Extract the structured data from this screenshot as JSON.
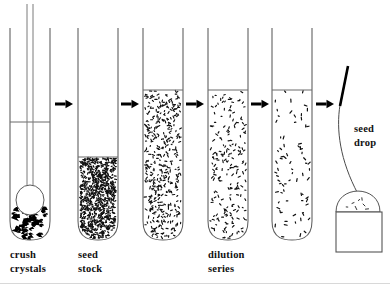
{
  "figure": {
    "background": "#ffffff",
    "ink_color": "#111111",
    "tube_stroke": "#5b5b5b"
  },
  "labels": [
    {
      "id": "crush-crystals",
      "line1": "crush",
      "line2": "crystals",
      "x": 10,
      "y": 258
    },
    {
      "id": "seed-stock",
      "line1": "seed",
      "line2": "stock",
      "x": 78,
      "y": 258
    },
    {
      "id": "dilution-series",
      "line1": "dilution",
      "line2": "series",
      "x": 208,
      "y": 258
    },
    {
      "id": "seed-drop",
      "line1": "seed",
      "line2": "drop",
      "x": 354,
      "y": 132
    }
  ],
  "tubes": [
    {
      "id": "tube-crush",
      "index": 1,
      "x": 10,
      "width": 40,
      "top": 28,
      "bottom": 240,
      "liquid_level": 122,
      "content": "crystals",
      "density": "chunks",
      "has_pestle": true,
      "label_ref": "crush-crystals"
    },
    {
      "id": "tube-seed-stock",
      "index": 2,
      "x": 78,
      "width": 40,
      "top": 28,
      "bottom": 240,
      "liquid_level": 157,
      "content": "microcrystal-slurry",
      "density": "very-high",
      "has_pestle": false,
      "label_ref": "seed-stock"
    },
    {
      "id": "tube-dilution-1",
      "index": 3,
      "x": 143,
      "width": 40,
      "top": 28,
      "bottom": 240,
      "liquid_level": 90,
      "content": "seed-suspension",
      "density": "high",
      "has_pestle": false,
      "label_ref": "dilution-series"
    },
    {
      "id": "tube-dilution-2",
      "index": 4,
      "x": 208,
      "width": 40,
      "top": 28,
      "bottom": 240,
      "liquid_level": 90,
      "content": "seed-suspension",
      "density": "medium",
      "has_pestle": false,
      "label_ref": "dilution-series"
    },
    {
      "id": "tube-dilution-3",
      "index": 5,
      "x": 272,
      "width": 40,
      "top": 28,
      "bottom": 240,
      "liquid_level": 90,
      "content": "seed-suspension",
      "density": "low",
      "has_pestle": false,
      "label_ref": "dilution-series"
    }
  ],
  "arrows": [
    {
      "id": "arrow-1",
      "x": 55,
      "y": 104,
      "length": 18,
      "direction": "right"
    },
    {
      "id": "arrow-2",
      "x": 121,
      "y": 104,
      "length": 18,
      "direction": "right"
    },
    {
      "id": "arrow-3",
      "x": 186,
      "y": 104,
      "length": 18,
      "direction": "right"
    },
    {
      "id": "arrow-4",
      "x": 251,
      "y": 104,
      "length": 18,
      "direction": "right"
    },
    {
      "id": "arrow-5",
      "x": 316,
      "y": 104,
      "length": 18,
      "direction": "right"
    }
  ],
  "seed_drop": {
    "id": "seed-drop-assembly",
    "whisker_tip_color": "#000000",
    "drop": {
      "cx": 358,
      "cy": 212,
      "rx": 22,
      "ry": 18
    },
    "slide": {
      "x": 336,
      "y": 212,
      "width": 46,
      "height": 40
    }
  }
}
